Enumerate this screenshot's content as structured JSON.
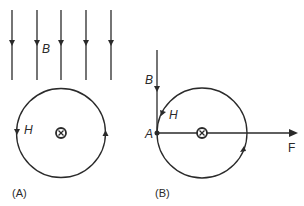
{
  "diagram": {
    "panel_a": {
      "label": "(A)",
      "field_label": "B",
      "h_label": "H",
      "field_lines_x": [
        12,
        37,
        61,
        86,
        111
      ],
      "current_symbol": "current-into-page-icon"
    },
    "panel_b": {
      "label": "(B)",
      "field_label": "B",
      "h_label": "H",
      "point_label": "A",
      "force_label": "F",
      "current_symbol": "current-into-page-icon"
    },
    "colors": {
      "stroke": "#2a2a2a",
      "background": "#ffffff"
    }
  }
}
